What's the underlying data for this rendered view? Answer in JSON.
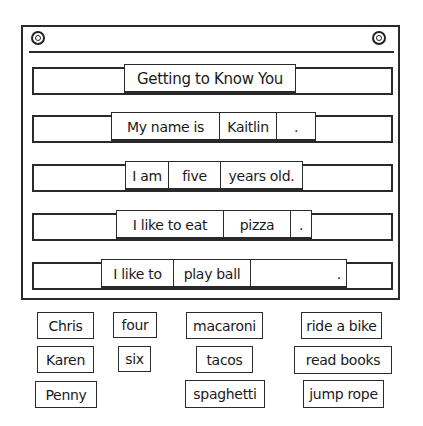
{
  "pocket_chart": {
    "title": "Getting to Know You",
    "sentences": [
      {
        "cards": [
          "My name is",
          "Kaitlin",
          "."
        ]
      },
      {
        "cards": [
          "I am",
          "five",
          "years old."
        ]
      },
      {
        "cards": [
          "I like to eat",
          "pizza",
          "."
        ]
      },
      {
        "cards": [
          "I like to",
          "play ball",
          "."
        ]
      }
    ]
  },
  "word_bank": {
    "names": [
      "Chris",
      "Karen",
      "Penny"
    ],
    "ages": [
      "four",
      "six"
    ],
    "foods": [
      "macaroni",
      "tacos",
      "spaghetti"
    ],
    "activities": [
      "ride a bike",
      "read books",
      "jump rope"
    ]
  }
}
